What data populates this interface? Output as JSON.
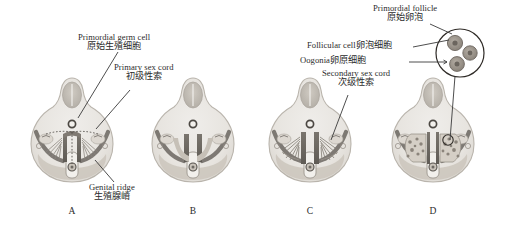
{
  "figure": {
    "background_color": "#ffffff",
    "panels": [
      {
        "letter": "A",
        "stage": "indifferent gonad with primordial germ cells and primary sex cords",
        "has_primary_cords": true,
        "has_secondary_cords": false,
        "has_follicles": false
      },
      {
        "letter": "B",
        "stage": "smooth genital ridge without cords",
        "has_primary_cords": false,
        "has_secondary_cords": false,
        "has_follicles": false
      },
      {
        "letter": "C",
        "stage": "secondary sex cords radiating into cortex",
        "has_primary_cords": false,
        "has_secondary_cords": true,
        "has_follicles": false
      },
      {
        "letter": "D",
        "stage": "ovary with primordial follicles",
        "has_primary_cords": false,
        "has_secondary_cords": false,
        "has_follicles": true
      }
    ],
    "labels": [
      {
        "id": "primordial-germ-cell",
        "en": "Primordial germ cell",
        "zh": "原始生殖细胞"
      },
      {
        "id": "primary-sex-cord",
        "en": "Primary sex cord",
        "zh": "初级性索"
      },
      {
        "id": "genital-ridge",
        "en": "Genital ridge",
        "zh": "生殖腺嵴"
      },
      {
        "id": "secondary-sex-cord",
        "en": "Secondary sex cord",
        "zh": "次级性索"
      },
      {
        "id": "follicular-cell",
        "en": "Follicular cell",
        "zh": "卵泡细胞"
      },
      {
        "id": "oogonia",
        "en": "Oogonia",
        "zh": "卵原细胞"
      },
      {
        "id": "primordial-follicle",
        "en": "Primordial follicle",
        "zh": "原始卵泡"
      }
    ],
    "inset": {
      "id": "primordial-follicle-inset",
      "oocyte_count": 3
    },
    "colors": {
      "body_fill": "#e9e7e2",
      "body_outline": "#b9b4ac",
      "cortex": "#cfc9c0",
      "medulla": "#b4aca2",
      "cord_dark": "#6e6a64",
      "gut_fill": "#f2f0ec",
      "neural_tube": "#bdb8b0",
      "label_text": "#2b2b2b",
      "leader_line": "#3a3a3a",
      "follicle_cell": "#9a948c"
    }
  }
}
